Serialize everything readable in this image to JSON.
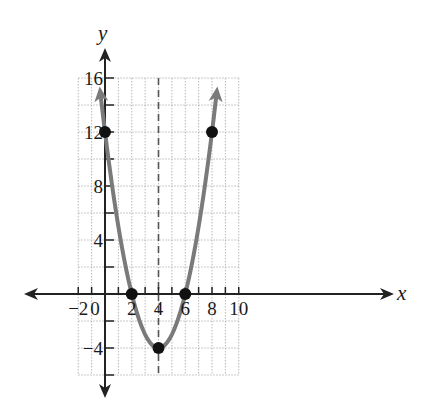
{
  "chart_data": {
    "type": "line",
    "title": "",
    "xlabel": "x",
    "ylabel": "y",
    "xlim": [
      -2,
      10
    ],
    "ylim": [
      -6,
      16
    ],
    "grid": true,
    "grid_step": {
      "x": 1,
      "y": 2
    },
    "x_tick_labels": [
      "-2",
      "0",
      "2",
      "4",
      "6",
      "8",
      "10"
    ],
    "y_tick_labels": [
      "-4",
      "4",
      "8",
      "12",
      "16"
    ],
    "series": [
      {
        "name": "parabola",
        "equation": "y = (x - 2)(x - 6)",
        "color": "#7a7a7a",
        "x_range": [
          -0.35,
          8.35
        ],
        "arrows": "both"
      }
    ],
    "points": [
      {
        "x": 0,
        "y": 12
      },
      {
        "x": 2,
        "y": 0
      },
      {
        "x": 4,
        "y": -4
      },
      {
        "x": 6,
        "y": 0
      },
      {
        "x": 8,
        "y": 12
      }
    ],
    "axis_of_symmetry": {
      "x": 4,
      "style": "dashed"
    },
    "vertex": {
      "x": 4,
      "y": -4
    },
    "annotations": []
  },
  "labels": {
    "x_axis": "x",
    "y_axis": "y",
    "x_ticks": [
      "−2",
      "0",
      "2",
      "4",
      "6",
      "8",
      "10"
    ],
    "y_ticks": [
      "−4",
      "4",
      "8",
      "12",
      "16"
    ]
  }
}
